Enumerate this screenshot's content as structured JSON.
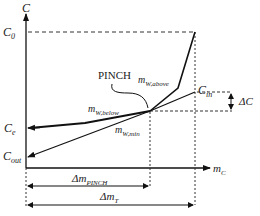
{
  "diagram": {
    "axes": {
      "y_label": "C",
      "x_label_main": "m",
      "x_label_sub": "C"
    },
    "levels": {
      "c0": {
        "main": "C",
        "sub": "0"
      },
      "c_in": {
        "main": "C",
        "sub": "in"
      },
      "c_e": {
        "main": "C",
        "sub": "e"
      },
      "c_out": {
        "main": "C",
        "sub": "out"
      },
      "delta_c": "ΔC"
    },
    "annotations": {
      "pinch": "PINCH",
      "m_w_above": {
        "main": "m",
        "sub": "W,above"
      },
      "m_w_below": {
        "main": "m",
        "sub": "W,below"
      },
      "m_w_min": {
        "main": "m",
        "sub": "W,min"
      }
    },
    "spans": {
      "delta_m_pinch": {
        "main": "Δm",
        "sub": "PINCH"
      },
      "delta_m_t": {
        "main": "Δm",
        "sub": "T"
      }
    },
    "colors": {
      "line": "#111111",
      "dashed": "#333333",
      "background": "#ffffff"
    }
  }
}
